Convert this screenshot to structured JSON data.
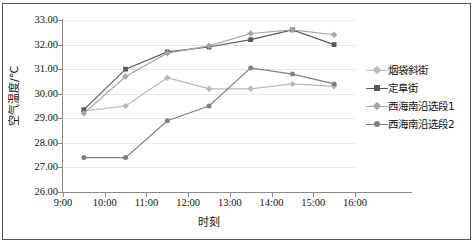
{
  "chart_data": {
    "type": "line",
    "title": "",
    "xlabel": "时刻",
    "ylabel": "空气温度/℃",
    "ylim": [
      26.0,
      33.0
    ],
    "ytick_step": 1.0,
    "ytick_labels": [
      "33.00",
      "32.00",
      "31.00",
      "30.00",
      "29.00",
      "28.00",
      "27.00",
      "26.00"
    ],
    "ytick_values": [
      33.0,
      32.0,
      31.0,
      30.0,
      29.0,
      28.0,
      27.0,
      26.0
    ],
    "xtick_labels": [
      "9:00",
      "10:00",
      "11:00",
      "12:00",
      "13:00",
      "14:00",
      "15:00",
      "16:00"
    ],
    "xtick_values": [
      9.0,
      10.0,
      11.0,
      12.0,
      13.0,
      14.0,
      15.0,
      16.0
    ],
    "xlim": [
      9.0,
      16.0
    ],
    "x": [
      9.5,
      10.5,
      11.5,
      12.5,
      13.5,
      14.5,
      15.5
    ],
    "x_labels": [
      "9:30",
      "10:30",
      "11:30",
      "12:30",
      "13:30",
      "14:30",
      "15:30"
    ],
    "grid": "horizontal",
    "legend_position": "right",
    "series": [
      {
        "name": "烟袋斜街",
        "color": "#b9b9b9",
        "marker": "diamond",
        "values": [
          29.3,
          29.5,
          30.65,
          30.2,
          30.2,
          30.4,
          30.3
        ]
      },
      {
        "name": "定阜街",
        "color": "#595959",
        "marker": "square",
        "values": [
          29.35,
          31.0,
          31.7,
          31.9,
          32.2,
          32.6,
          32.0
        ]
      },
      {
        "name": "西海南沿选段1",
        "color": "#a6a6a6",
        "marker": "diamond",
        "values": [
          29.2,
          30.7,
          31.65,
          31.95,
          32.45,
          32.6,
          32.4
        ]
      },
      {
        "name": "西海南沿选段2",
        "color": "#808080",
        "marker": "circle",
        "values": [
          27.4,
          27.4,
          28.9,
          29.5,
          31.05,
          30.8,
          30.4
        ]
      }
    ]
  },
  "legend": {
    "items": [
      {
        "label": "烟袋斜街"
      },
      {
        "label": "定阜街"
      },
      {
        "label": "西海南沿选段1"
      },
      {
        "label": "西海南沿选段2"
      }
    ]
  },
  "colors": {
    "grid": "#e6e6e6",
    "axis": "#8a8a8a",
    "frame": "#555555",
    "text": "#111111",
    "background": "#ffffff"
  }
}
